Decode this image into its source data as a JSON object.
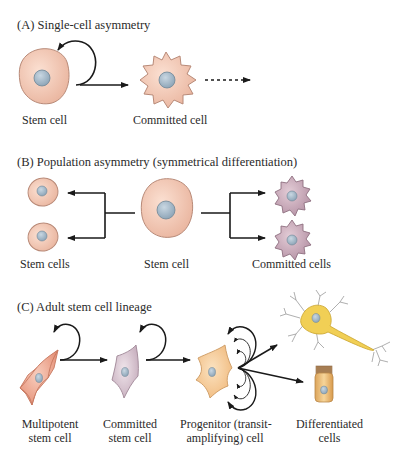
{
  "panels": {
    "a": {
      "title": "(A)  Single-cell asymmetry",
      "labels": {
        "stem_cell": "Stem cell",
        "committed_cell": "Committed cell"
      }
    },
    "b": {
      "title": "(B)  Population asymmetry (symmetrical differentiation)",
      "labels": {
        "stem_cells": "Stem cells",
        "stem_cell": "Stem cell",
        "committed_cells": "Committed cells"
      }
    },
    "c": {
      "title": "(C)  Adult stem cell lineage",
      "labels": {
        "multipotent_1": "Multipotent",
        "multipotent_2": "stem cell",
        "committed_1": "Committed",
        "committed_2": "stem cell",
        "progenitor_1": "Progenitor (transit-",
        "progenitor_2": "amplifying) cell",
        "differentiated_1": "Differentiated",
        "differentiated_2": "cells"
      }
    }
  },
  "colors": {
    "stem_cell_fill": "#f2c4b0",
    "stem_cell_stroke": "#b88a78",
    "nucleus_fill": "#9fb4c4",
    "committed_purple": "#c9aab8",
    "multipotent_red": "#eba48e",
    "committed_stem_lilac": "#d8c6d2",
    "progenitor_peach": "#f4cc9c",
    "neuron_yellow": "#f1cf55",
    "epithelial_tan": "#e8b86a",
    "arrow": "#1a1a1a"
  }
}
